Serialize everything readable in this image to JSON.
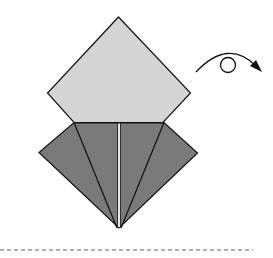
{
  "diagram": {
    "type": "origami-step",
    "colors": {
      "light_paper": "#d4d4d4",
      "dark_paper": "#7a7a7a",
      "outline": "#111111",
      "center_strip": "#e6e6e6",
      "dashed_line": "#666666"
    },
    "top_diamond": {
      "points": [
        [
          118.5,
          17
        ],
        [
          190.5,
          93
        ],
        [
          163,
          122.5
        ],
        [
          74,
          122.5
        ],
        [
          47.5,
          93
        ]
      ]
    },
    "bottom_flaps": {
      "outer": [
        [
          74,
          122.5
        ],
        [
          164,
          122.5
        ],
        [
          197.5,
          153
        ],
        [
          119,
          228
        ],
        [
          39,
          152.5
        ]
      ],
      "crease_lines": [
        [
          [
            74,
            122.5
          ],
          [
            117,
            228
          ]
        ],
        [
          [
            164,
            122.5
          ],
          [
            121,
            228
          ]
        ]
      ],
      "center_strip": {
        "x": 117.5,
        "y": 122.5,
        "width": 3,
        "height": 105
      }
    },
    "turn_over_symbol": {
      "name": "turn-over-arrow",
      "arc_start": [
        196,
        72
      ],
      "arc_peak": [
        228,
        54
      ],
      "arc_end": [
        262,
        72
      ],
      "loop_center": [
        228,
        65
      ],
      "loop_radius": 8
    },
    "divider": {
      "y": 250,
      "x_start": 0,
      "x_end": 253
    }
  }
}
